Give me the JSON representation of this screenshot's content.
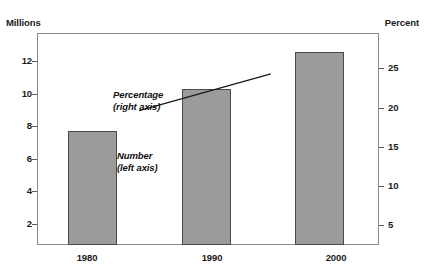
{
  "chart_data": {
    "type": "bar",
    "categories": [
      "1980",
      "1990",
      "2000"
    ],
    "series": [
      {
        "name": "Number",
        "axis": "left",
        "unit": "Millions",
        "type": "bar",
        "values": [
          7.0,
          9.6,
          11.9
        ]
      },
      {
        "name": "Percentage",
        "axis": "right",
        "unit": "Percent",
        "type": "line",
        "values": [
          17.2,
          19.5,
          21.9
        ]
      }
    ],
    "left_axis": {
      "label": "Millions",
      "ticks": [
        2,
        4,
        6,
        8,
        10,
        12
      ],
      "range": [
        0,
        13
      ]
    },
    "right_axis": {
      "label": "Percent",
      "ticks": [
        5,
        10,
        15,
        20,
        25
      ],
      "range": [
        0,
        27
      ]
    },
    "annotations": [
      {
        "name": "percentage",
        "line1": "Percentage",
        "line2": "(right axis)"
      },
      {
        "name": "number",
        "line1": "Number",
        "line2": "(left axis)"
      }
    ],
    "grid": false,
    "legend": "inline-annotations",
    "colors": {
      "bar_fill": "#9b9b9b",
      "bar_border": "#4a4a4a",
      "line": "#1a1a1a",
      "axis": "#8a8a8a",
      "text": "#111111",
      "background": "#ffffff"
    }
  },
  "axis_labels": {
    "left_title": "Millions",
    "right_title": "Percent",
    "left_ticks": [
      "12",
      "10",
      "8",
      "6",
      "4",
      "2"
    ],
    "right_ticks": [
      "25",
      "20",
      "15",
      "10",
      "5"
    ],
    "x_ticks": [
      "1980",
      "1990",
      "2000"
    ]
  },
  "annotations": {
    "percentage_line1": "Percentage",
    "percentage_line2": "(right axis)",
    "number_line1": "Number",
    "number_line2": "(left axis)"
  }
}
